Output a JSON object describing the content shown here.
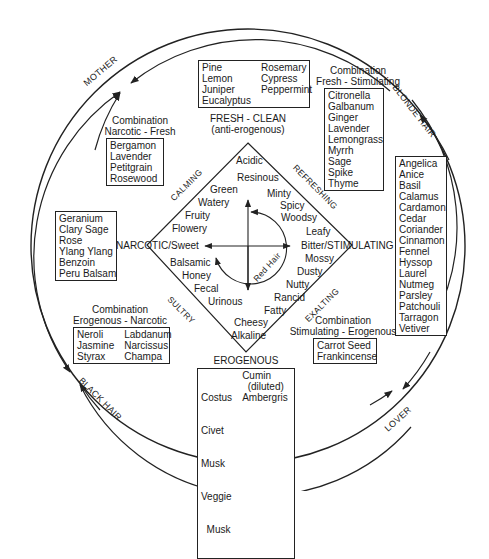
{
  "ring": {
    "mother": "MOTHER",
    "blonde_hair": "BLONDE HAIR",
    "black_hair": "BLACK HAIR",
    "lover": "LOVER"
  },
  "axes": {
    "top": "FRESH - CLEAN",
    "top_sub": "(anti-erogenous)",
    "bottom": "EROGENOUS",
    "left": "NARCOTIC/Sweet",
    "right": "Bitter/STIMULATING",
    "center_arc": "Red Hair"
  },
  "diamond_edges": {
    "top_left": "CALMING",
    "top_right": "REFRESHING",
    "bottom_left": "SULTRY",
    "bottom_right": "EXALTING"
  },
  "diamond_words": {
    "top": [
      "Acidic",
      "Resinous"
    ],
    "top_left": [
      "Green",
      "Watery",
      "Fruity",
      "Flowery"
    ],
    "top_right": [
      "Minty",
      "Spicy",
      "Woodsy",
      "Leafy"
    ],
    "bottom_left": [
      "Balsamic",
      "Honey",
      "Fecal",
      "Urinous"
    ],
    "bottom_right": [
      "Mossy",
      "Dusty",
      "Nutty",
      "Rancid",
      "Fatty"
    ],
    "bottom": [
      "Cheesy",
      "Alkaline"
    ]
  },
  "groups": {
    "fresh_clean": {
      "col1": [
        "Pine",
        "Lemon",
        "Juniper",
        "Eucalyptus"
      ],
      "col2": [
        "Rosemary",
        "Cypress",
        "Peppermint"
      ]
    },
    "fresh_stimulating": {
      "title1": "Combination",
      "title2": "Fresh - Stimulating",
      "items": [
        "Citronella",
        "Galbanum",
        "Ginger",
        "Lavender",
        "Lemongrass",
        "Myrrh",
        "Sage",
        "Spike",
        "Thyme"
      ]
    },
    "narcotic_fresh": {
      "title1": "Combination",
      "title2": "Narcotic - Fresh",
      "items": [
        "Bergamon",
        "Lavender",
        "Petitgrain",
        "Rosewood"
      ]
    },
    "narcotic": {
      "items": [
        "Geranium",
        "Clary Sage",
        "Rose",
        "Ylang Ylang",
        "Benzoin",
        "Peru Balsam"
      ]
    },
    "stimulating": {
      "items": [
        "Angelica",
        "Anice",
        "Basil",
        "Calamus",
        "Cardamon",
        "Cedar",
        "Coriander",
        "Cinnamon",
        "Fennel",
        "Hyssop",
        "Laurel",
        "Nutmeg",
        "Parsley",
        "Patchouli",
        "Tarragon",
        "Vetiver"
      ]
    },
    "erogenous_narcotic": {
      "title1": "Combination",
      "title2": "Erogenous - Narcotic",
      "col1": [
        "Neroli",
        "Jasmine",
        "Styrax"
      ],
      "col2": [
        "Labdanum",
        "Narcissus",
        "Champa"
      ]
    },
    "stimulating_erogenous": {
      "title1": "Combination",
      "title2": "Stimulating - Erogenous",
      "items": [
        "Carrot Seed",
        "Frankincense"
      ]
    },
    "erogenous": {
      "col1": [
        "Costus",
        "Civet",
        "Musk",
        "Veggie",
        "  Musk"
      ],
      "col2": [
        "Cumin",
        "  (diluted)",
        "Ambergris"
      ]
    }
  }
}
